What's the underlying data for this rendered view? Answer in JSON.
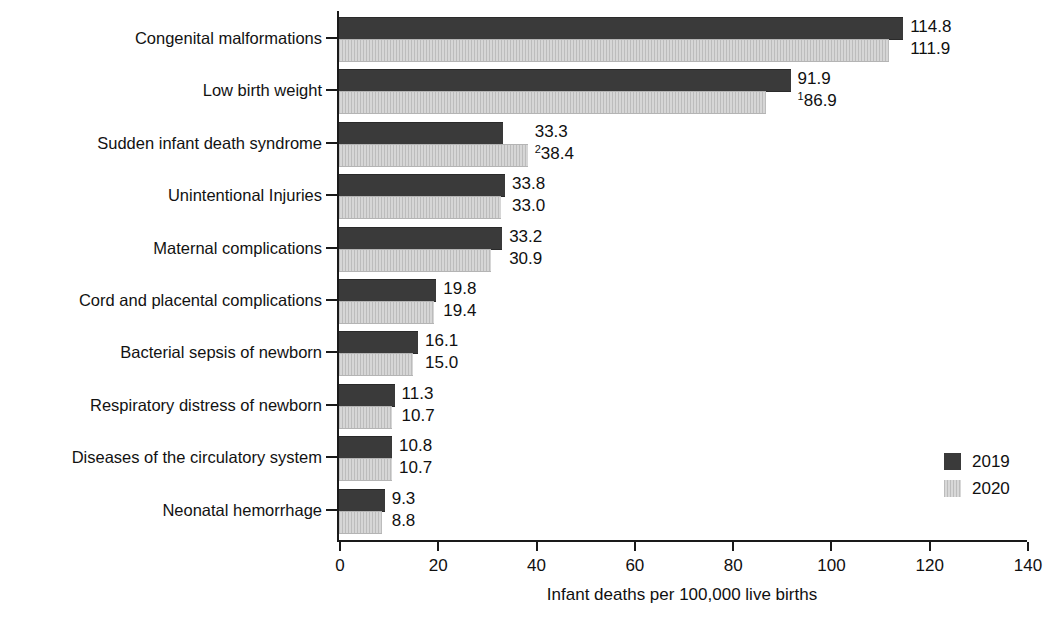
{
  "chart_data": {
    "type": "bar",
    "orientation": "horizontal",
    "title": "",
    "xlabel": "Infant deaths per 100,000 live births",
    "ylabel": "",
    "xlim": [
      0,
      140
    ],
    "xticks": [
      0,
      20,
      40,
      60,
      80,
      100,
      120,
      140
    ],
    "xtick_labels": [
      "0",
      "20",
      "40",
      "60",
      "80",
      "100",
      "120",
      "140"
    ],
    "grid": false,
    "legend_position": "bottom-right",
    "categories": [
      "Congenital malformations",
      "Low birth weight",
      "Sudden infant death syndrome",
      "Unintentional Injuries",
      "Maternal complications",
      "Cord and placental complications",
      "Bacterial sepsis of newborn",
      "Respiratory distress of newborn",
      "Diseases of the circulatory system",
      "Neonatal hemorrhage"
    ],
    "series": [
      {
        "name": "2019",
        "color": "#3a3a3a",
        "values": [
          114.8,
          91.9,
          33.3,
          33.8,
          33.2,
          19.8,
          16.1,
          11.3,
          10.8,
          9.3
        ],
        "labels": [
          "114.8",
          "91.9",
          "33.3",
          "33.8",
          "33.2",
          "19.8",
          "16.1",
          "11.3",
          "10.8",
          "9.3"
        ],
        "label_superscripts": [
          "",
          "",
          "",
          "",
          "",
          "",
          "",
          "",
          "",
          ""
        ]
      },
      {
        "name": "2020",
        "color": "#c9c9c9",
        "values": [
          111.9,
          86.9,
          38.4,
          33.0,
          30.9,
          19.4,
          15.0,
          10.7,
          10.7,
          8.8
        ],
        "labels": [
          "111.9",
          "86.9",
          "38.4",
          "33.0",
          "30.9",
          "19.4",
          "15.0",
          "10.7",
          "10.7",
          "8.8"
        ],
        "label_superscripts": [
          "",
          "1",
          "2",
          "",
          "",
          "",
          "",
          "",
          "",
          ""
        ]
      }
    ]
  },
  "legend": {
    "entries": [
      {
        "label": "2019",
        "swatch": "dark-solid-swatch"
      },
      {
        "label": "2020",
        "swatch": "light-striped-swatch"
      }
    ]
  }
}
